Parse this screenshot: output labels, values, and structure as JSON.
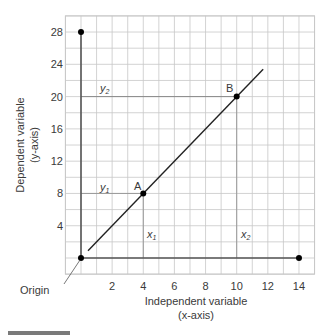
{
  "chart_data": {
    "type": "line",
    "title": "",
    "xlabel": "Independent variable",
    "xlabel_sub": "(x-axis)",
    "ylabel": "Dependent variable",
    "ylabel_sub": "(y-axis)",
    "xlim": [
      -1,
      15
    ],
    "ylim": [
      -2,
      30
    ],
    "grid": true,
    "x_ticks": [
      2,
      4,
      6,
      8,
      10,
      12,
      14
    ],
    "y_ticks": [
      4,
      8,
      12,
      16,
      20,
      24,
      28
    ],
    "series": [
      {
        "name": "y = 2x",
        "x": [
          0.45,
          11.7
        ],
        "y": [
          0.9,
          23.4
        ]
      }
    ],
    "points": [
      {
        "name": "Origin",
        "x": 0,
        "y": 0
      },
      {
        "name": "A",
        "x": 4,
        "y": 8
      },
      {
        "name": "B",
        "x": 10,
        "y": 20
      },
      {
        "name": "y-axis end",
        "x": 0,
        "y": 28
      },
      {
        "name": "x-axis end",
        "x": 14,
        "y": 0
      }
    ],
    "annotations": {
      "origin": "Origin",
      "point_a": "A",
      "point_b": "B",
      "y1": "y",
      "y1_sub": "1",
      "y2": "y",
      "y2_sub": "2",
      "x1": "x",
      "x1_sub": "1",
      "x2": "x",
      "x2_sub": "2"
    }
  },
  "colors": {
    "grid": "#c8c8c8",
    "axis": "#555555",
    "line": "#222222",
    "point": "#000000",
    "footer_bar": "#7a7a7a"
  }
}
